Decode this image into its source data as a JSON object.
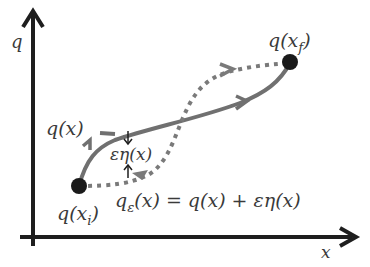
{
  "diagram": {
    "title": "",
    "axes": {
      "y_label": "q",
      "x_label": "x"
    },
    "endpoints": {
      "initial": {
        "label_main": "q(x",
        "label_sub": "i",
        "label_close": ")"
      },
      "final": {
        "label_main": "q(x",
        "label_sub": "f",
        "label_close": ")"
      }
    },
    "paths": {
      "true_path": {
        "label": "q(x)",
        "style": "solid",
        "color": "#707070"
      },
      "varied_path": {
        "label_main": "q",
        "label_sub": "ε",
        "label_rest": "(x) = q(x) + εη(x)",
        "style": "dotted",
        "color": "#7a7a7a"
      }
    },
    "variation": {
      "label": "εη(x)"
    },
    "colors": {
      "axis": "#1e1e1e",
      "point": "#1a1a1a",
      "text": "#3a3a3a"
    }
  }
}
